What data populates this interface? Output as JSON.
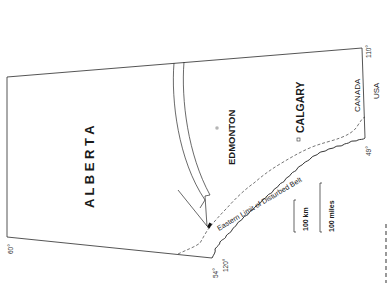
{
  "map": {
    "province_label": "A L B E R T A",
    "cities": [
      {
        "name": "EDMONTON",
        "marker": "square-dot"
      },
      {
        "name": "CALGARY",
        "marker": "open-square"
      }
    ],
    "feature_label": "Eastern Limit of Disturbed Belt",
    "border_labels": {
      "north": "CANADA",
      "south": "USA"
    },
    "coordinates": {
      "lat_north": "60°",
      "lat_corner": "54°",
      "lon_west": "120°",
      "lat_south": "49°",
      "lon_east": "110°"
    },
    "scale_bars": [
      {
        "label": "100 km"
      },
      {
        "label": "100 miles"
      }
    ],
    "colors": {
      "ink": "#1a1a1a",
      "background": "#ffffff"
    }
  }
}
